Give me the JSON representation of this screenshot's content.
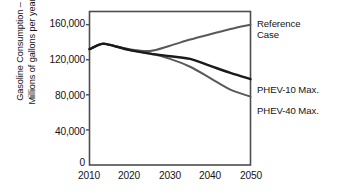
{
  "chart_data": {
    "type": "line",
    "title": "",
    "xlabel": "",
    "ylabel": "Gasoline Consumption –\nMillions of gallons per year",
    "xlim": [
      2010,
      2050
    ],
    "ylim": [
      0,
      175000
    ],
    "grid": false,
    "legend_position": "right-inline",
    "xticks": [
      "2010",
      "2020",
      "2030",
      "2040",
      "2050"
    ],
    "xtick_values": [
      2010,
      2020,
      2030,
      2040,
      2050
    ],
    "yticks": [
      "0",
      "40,000",
      "80,000",
      "120,000",
      "160,000"
    ],
    "ytick_values": [
      0,
      40000,
      80000,
      120000,
      160000
    ],
    "x": [
      2010,
      2013,
      2015,
      2020,
      2025,
      2030,
      2035,
      2040,
      2045,
      2050
    ],
    "series": [
      {
        "name": "Reference Case",
        "label": "Reference\nCase",
        "color": "#595959",
        "values": [
          132000,
          138000,
          137000,
          132000,
          130000,
          136000,
          143000,
          149000,
          155000,
          160000
        ]
      },
      {
        "name": "PHEV-10 Max.",
        "label": "PHEV-10 Max.",
        "color": "#1a1a1a",
        "values": [
          132000,
          138000,
          137000,
          131000,
          127000,
          124000,
          121000,
          113000,
          105000,
          98000
        ]
      },
      {
        "name": "PHEV-40 Max.",
        "label": "PHEV-40 Max.",
        "color": "#595959",
        "values": [
          132000,
          138000,
          137000,
          131000,
          127000,
          121000,
          112000,
          99000,
          86000,
          78000
        ]
      }
    ]
  },
  "axes": {
    "frame_color": "#4d4d4d"
  }
}
